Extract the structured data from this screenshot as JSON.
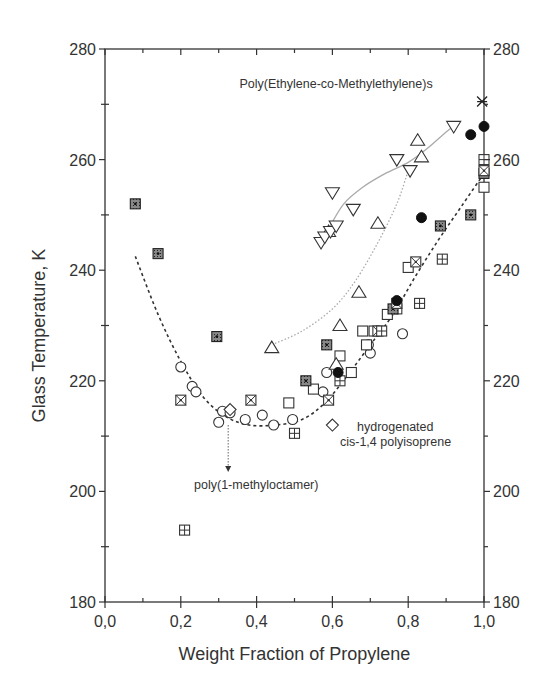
{
  "chart_data": {
    "type": "scatter",
    "title": "",
    "xlabel": "Weight Fraction of Propylene",
    "ylabel": "Glass Temperature, K",
    "xlim": [
      0.0,
      1.0
    ],
    "ylim": [
      180,
      280
    ],
    "x_ticks": [
      "0,0",
      "0,2",
      "0,4",
      "0,6",
      "0,8",
      "1,0"
    ],
    "x_tick_values": [
      0.0,
      0.2,
      0.4,
      0.6,
      0.8,
      1.0
    ],
    "y_ticks": [
      "180",
      "200",
      "220",
      "240",
      "260",
      "280"
    ],
    "y_tick_values": [
      180,
      200,
      220,
      240,
      260,
      280
    ],
    "right_axis_mirror": true,
    "grid": false,
    "legend": null,
    "annotations": [
      {
        "text": "Poly(Ethylene-co-Methylethylene)s",
        "x": 0.355,
        "y": 273
      },
      {
        "text": "hydrogenated",
        "x": 0.665,
        "y": 211
      },
      {
        "text": "cis-1,4 polyisoprene",
        "x": 0.62,
        "y": 208.3
      },
      {
        "text": "poly(1-methyloctamer)",
        "x": 0.235,
        "y": 200.5
      }
    ],
    "arrow": {
      "from": [
        0.325,
        212
      ],
      "to": [
        0.325,
        203.5
      ],
      "style": "dotted"
    },
    "series": [
      {
        "name": "open-circle",
        "marker": "circle-open",
        "points": [
          [
            0.2,
            222.5
          ],
          [
            0.23,
            219
          ],
          [
            0.24,
            218
          ],
          [
            0.3,
            212.5
          ],
          [
            0.31,
            214.5
          ],
          [
            0.33,
            214.2
          ],
          [
            0.37,
            213
          ],
          [
            0.415,
            213.8
          ],
          [
            0.445,
            212
          ],
          [
            0.495,
            213
          ],
          [
            0.575,
            218
          ],
          [
            0.585,
            221.5
          ],
          [
            0.7,
            225
          ],
          [
            0.695,
            226.5
          ],
          [
            0.785,
            228.5
          ]
        ]
      },
      {
        "name": "open-square",
        "marker": "square-open",
        "points": [
          [
            0.485,
            216
          ],
          [
            0.55,
            218.5
          ],
          [
            0.62,
            224.5
          ],
          [
            0.65,
            221.5
          ],
          [
            0.68,
            229
          ],
          [
            0.69,
            226.5
          ],
          [
            0.71,
            229
          ],
          [
            0.745,
            232
          ],
          [
            0.77,
            233
          ],
          [
            0.8,
            240.5
          ],
          [
            1.0,
            255
          ]
        ]
      },
      {
        "name": "dotted-square",
        "marker": "square-dot",
        "points": [
          [
            0.08,
            252
          ],
          [
            0.14,
            243
          ],
          [
            0.295,
            228
          ],
          [
            0.53,
            220
          ],
          [
            0.585,
            226.5
          ],
          [
            0.885,
            248
          ],
          [
            0.965,
            250
          ],
          [
            1.0,
            257.5
          ],
          [
            0.76,
            233
          ]
        ]
      },
      {
        "name": "crossed-square",
        "marker": "square-x",
        "points": [
          [
            0.2,
            216.5
          ],
          [
            0.385,
            216.5
          ],
          [
            0.59,
            216.5
          ],
          [
            0.72,
            229
          ],
          [
            0.82,
            241.5
          ],
          [
            0.77,
            234
          ],
          [
            1.0,
            258
          ]
        ]
      },
      {
        "name": "plus-square",
        "marker": "square-plus",
        "points": [
          [
            0.21,
            193
          ],
          [
            0.5,
            210.5
          ],
          [
            0.62,
            220
          ],
          [
            0.73,
            229
          ],
          [
            0.83,
            234
          ],
          [
            0.89,
            242
          ],
          [
            1.0,
            260
          ]
        ]
      },
      {
        "name": "open-triangle-up",
        "marker": "triangle-up",
        "points": [
          [
            0.44,
            226
          ],
          [
            0.61,
            223
          ],
          [
            0.62,
            230
          ],
          [
            0.67,
            236
          ],
          [
            0.72,
            248.5
          ],
          [
            0.835,
            260.5
          ],
          [
            0.825,
            263.5
          ],
          [
            0.59,
            247
          ]
        ]
      },
      {
        "name": "open-triangle-down",
        "marker": "triangle-down",
        "points": [
          [
            0.57,
            245
          ],
          [
            0.58,
            246
          ],
          [
            0.595,
            247
          ],
          [
            0.61,
            248
          ],
          [
            0.6,
            254
          ],
          [
            0.655,
            251
          ],
          [
            0.77,
            260
          ],
          [
            0.805,
            258
          ],
          [
            0.92,
            266
          ]
        ]
      },
      {
        "name": "filled-circle",
        "marker": "circle-filled",
        "points": [
          [
            0.615,
            221.5
          ],
          [
            0.77,
            234.5
          ],
          [
            0.835,
            249.5
          ],
          [
            0.965,
            264.5
          ],
          [
            1.0,
            266
          ]
        ]
      },
      {
        "name": "open-diamond",
        "marker": "diamond",
        "points": [
          [
            0.33,
            214.8
          ],
          [
            0.6,
            212
          ]
        ]
      },
      {
        "name": "star",
        "marker": "star",
        "points": [
          [
            0.995,
            270.5
          ]
        ]
      }
    ],
    "curves": [
      {
        "name": "dashed-fit",
        "style": "dashed",
        "color": "#333333",
        "points": [
          [
            0.08,
            242.5
          ],
          [
            0.14,
            232
          ],
          [
            0.2,
            223.5
          ],
          [
            0.26,
            217
          ],
          [
            0.32,
            213.5
          ],
          [
            0.38,
            212
          ],
          [
            0.45,
            212
          ],
          [
            0.52,
            213
          ],
          [
            0.58,
            216
          ],
          [
            0.64,
            221
          ],
          [
            0.7,
            226.5
          ],
          [
            0.76,
            232
          ],
          [
            0.82,
            239
          ],
          [
            0.88,
            245.5
          ],
          [
            0.94,
            251.5
          ],
          [
            1.0,
            257.5
          ]
        ]
      },
      {
        "name": "dotted-fit",
        "style": "dotted",
        "color": "#aaaaaa",
        "points": [
          [
            0.44,
            226.5
          ],
          [
            0.52,
            229
          ],
          [
            0.6,
            233
          ],
          [
            0.66,
            238
          ],
          [
            0.72,
            245
          ],
          [
            0.77,
            252
          ],
          [
            0.8,
            258
          ]
        ]
      },
      {
        "name": "solid-fit",
        "style": "solid",
        "color": "#aaaaaa",
        "points": [
          [
            0.59,
            247.5
          ],
          [
            0.63,
            252
          ],
          [
            0.68,
            255
          ],
          [
            0.74,
            257.5
          ],
          [
            0.8,
            259.5
          ],
          [
            0.85,
            262
          ],
          [
            0.9,
            265
          ],
          [
            0.93,
            266.5
          ]
        ]
      }
    ]
  }
}
